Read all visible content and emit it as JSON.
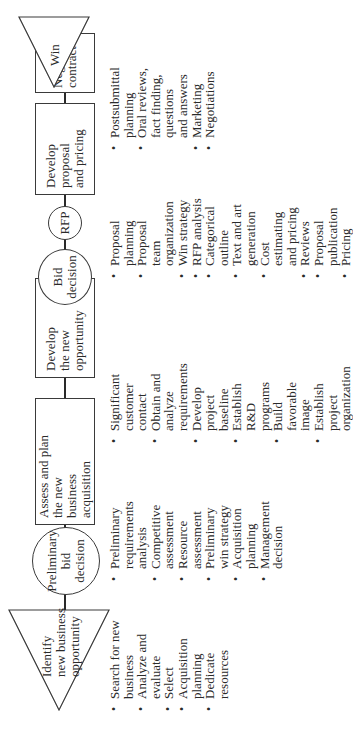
{
  "diagram": {
    "orientation": "rotated -90 degrees; flow runs bottom to top",
    "steps": [
      {
        "shape": "triangle",
        "label_lines": [
          "Identify",
          "new business",
          "opportunity"
        ],
        "bullets": [
          "Search for new\nbusiness",
          "Analyze and\nevaluate",
          "Select",
          "Acquisition\nplanning",
          "Dedicate\nresources"
        ]
      },
      {
        "shape": "circle",
        "label_lines": [
          "Preliminary",
          "bid",
          "decision"
        ],
        "bullets": []
      },
      {
        "shape": "box",
        "label_lines": [
          "Assess and plan",
          "the new",
          "business",
          "acquisition"
        ],
        "bullets": [
          "Preliminary\nrequirements\nanalysis",
          "Competitive\nassessment",
          "Resource\nassessment",
          "Preliminary\nwin strategy",
          "Acquisition\nplanning",
          "Management\ndecision"
        ]
      },
      {
        "shape": "box",
        "label_lines": [
          "Develop",
          "the new",
          "opportunity"
        ],
        "bullets": [
          "Significant\ncustomer\ncontact",
          "Obtain and\nanalyze\nrequirements",
          "Develop\nproject\nbaseline",
          "Establish\nR&D\nprograms",
          "Build\nfavorable\nimage",
          "Establish\nproject\norganization"
        ]
      },
      {
        "shape": "circle",
        "label_lines": [
          "Bid",
          "decision"
        ],
        "bullets": []
      },
      {
        "shape": "circle",
        "label_lines": [
          "RFP"
        ],
        "bullets": []
      },
      {
        "shape": "box",
        "label_lines": [
          "Develop",
          "proposal",
          "and pricing"
        ],
        "bullets": [
          "Proposal\nplanning",
          "Proposal\nteam\norganization",
          "Win strategy",
          "RFP analysis",
          "Categorical\noutline",
          "Text and art\ngeneration",
          "Cost\nestimating\nand pricing",
          "Reviews",
          "Proposal\npublication",
          "Pricing"
        ]
      },
      {
        "shape": "box",
        "label_lines": [
          "Negotiate",
          "contract"
        ],
        "bullets": [
          "Postsubmittal\nplanning",
          "Oral reviews,\nfact finding,\nquestions\nand answers",
          "Marketing",
          "Negotiations"
        ]
      },
      {
        "shape": "triangle",
        "label_lines": [
          "Win"
        ],
        "bullets": []
      }
    ]
  }
}
